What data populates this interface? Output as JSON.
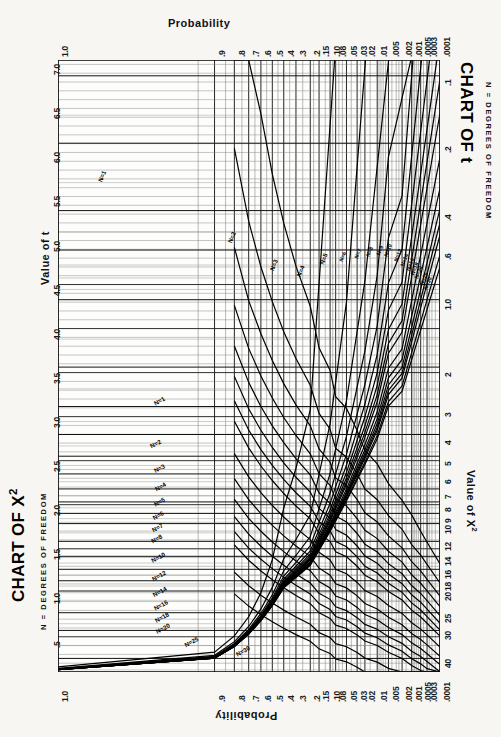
{
  "document": {
    "kind": "statistical-nomogram-sheet",
    "orientation": "rotated-90-degrees",
    "background_color": "#f7f6f3",
    "ink_color": "#111111"
  },
  "chart_t": {
    "title": "CHART OF t",
    "subtitle": "N = DEGREES OF FREEDOM",
    "value_axis_title": "Value of t",
    "probability_axis_title": "Probability",
    "value_ticks": [
      "7.0",
      "6.5",
      "6.0",
      "5.5",
      "5.0",
      "4.5",
      "4.0",
      "3.5",
      "3.0",
      "2.5",
      "2.0",
      "1.5",
      "1.0",
      ".5"
    ],
    "probability_ticks": [
      "1.0",
      ".9",
      ".8",
      ".7",
      ".6",
      ".5",
      ".4",
      ".3",
      ".2",
      ".15",
      ".10",
      ".08",
      ".05",
      ".03",
      ".02",
      ".01",
      ".005",
      ".002",
      ".001",
      ".0005",
      ".0003",
      ".0001"
    ],
    "curve_labels": [
      "N=1",
      "N=2",
      "N=3",
      "N=4",
      "N=5",
      "N=6",
      "N=7",
      "N=8",
      "N=9",
      "N=10",
      "N=12",
      "N=14",
      "N=16",
      "N=18",
      "N=20",
      "N=25",
      "N=30"
    ]
  },
  "chart_chisq": {
    "title": "CHART OF X2",
    "title_base": "CHART OF X",
    "title_exponent": "2",
    "subtitle": "N = DEGREES OF FREEDOM",
    "value_axis_title": "Value of X2",
    "value_axis_title_base": "Value of X",
    "value_axis_title_exponent": "2",
    "probability_axis_title": "Probability",
    "value_ticks": [
      ".1",
      ".2",
      ".4",
      ".6",
      "1.0",
      "2",
      "3",
      "4",
      "5",
      "6",
      "7",
      "8",
      "9",
      "10",
      "12",
      "14",
      "16",
      "18",
      "20",
      "25",
      "30",
      "40"
    ],
    "probability_ticks": [
      ".0001",
      ".0003",
      ".0005",
      ".001",
      ".002",
      ".005",
      ".01",
      ".02",
      ".03",
      ".05",
      ".08",
      ".10",
      ".15",
      ".2",
      ".3",
      ".4",
      ".5",
      ".6",
      ".7",
      ".8",
      ".9",
      "1.0"
    ],
    "curve_labels": [
      "N=1",
      "N=2",
      "N=3",
      "N=4",
      "N=5",
      "N=6",
      "N=7",
      "N=8",
      "N=10",
      "N=12",
      "N=14",
      "N=16",
      "N=18",
      "N=20",
      "N=25",
      "N=30"
    ]
  },
  "chart_data": {
    "type": "line",
    "subtitle": "N = DEGREES OF FREEDOM",
    "grid": true,
    "legend": "inline-curve-labels",
    "xlabel": "Probability",
    "ylabel_t": "Value of t",
    "ylabel_chisq": "Value of X2",
    "x": [
      0.0001,
      0.0003,
      0.0005,
      0.001,
      0.002,
      0.005,
      0.01,
      0.02,
      0.03,
      0.05,
      0.08,
      0.1,
      0.15,
      0.2,
      0.3,
      0.4,
      0.5,
      0.6,
      0.7,
      0.8,
      0.9,
      1.0
    ],
    "xlim_t": [
      1.0,
      0.0001
    ],
    "ylim_t": [
      7.0,
      0.0
    ],
    "xlim_chisq": [
      0.0001,
      1.0
    ],
    "ylim_chisq": [
      0.1,
      45
    ],
    "series_t": [
      {
        "name": "N=1",
        "values": [
          636.6,
          212.2,
          127.3,
          63.66,
          31.82,
          12.71,
          6.314,
          3.078,
          2.414,
          1.963,
          1.376,
          1.0,
          0.727,
          0.51,
          0.325,
          0.158,
          0.0
        ]
      },
      {
        "name": "N=2",
        "values": [
          31.6,
          17.28,
          14.09,
          9.925,
          6.965,
          4.303,
          2.92,
          1.886,
          1.604,
          1.386,
          1.061,
          0.816,
          0.617,
          0.445,
          0.289,
          0.142,
          0.0
        ]
      },
      {
        "name": "N=3",
        "values": [
          12.92,
          9.21,
          7.85,
          5.841,
          4.541,
          3.182,
          2.353,
          1.638,
          1.423,
          1.25,
          0.978,
          0.765,
          0.584,
          0.424,
          0.277,
          0.137,
          0.0
        ]
      },
      {
        "name": "N=4",
        "values": [
          8.61,
          6.62,
          5.95,
          4.604,
          3.747,
          2.776,
          2.132,
          1.533,
          1.344,
          1.19,
          0.941,
          0.741,
          0.569,
          0.414,
          0.271,
          0.134,
          0.0
        ]
      },
      {
        "name": "N=5",
        "values": [
          6.869,
          5.51,
          5.03,
          4.032,
          3.365,
          2.571,
          2.015,
          1.476,
          1.301,
          1.156,
          0.92,
          0.727,
          0.559,
          0.408,
          0.267,
          0.132,
          0.0
        ]
      },
      {
        "name": "N=6",
        "values": [
          5.959,
          4.9,
          4.52,
          3.707,
          3.143,
          2.447,
          1.943,
          1.44,
          1.273,
          1.134,
          0.906,
          0.718,
          0.553,
          0.404,
          0.265,
          0.131,
          0.0
        ]
      },
      {
        "name": "N=7",
        "values": [
          5.408,
          4.53,
          4.21,
          3.499,
          2.998,
          2.365,
          1.895,
          1.415,
          1.254,
          1.119,
          0.896,
          0.711,
          0.549,
          0.402,
          0.263,
          0.13,
          0.0
        ]
      },
      {
        "name": "N=8",
        "values": [
          5.041,
          4.28,
          3.99,
          3.355,
          2.896,
          2.306,
          1.86,
          1.397,
          1.24,
          1.108,
          0.889,
          0.706,
          0.546,
          0.399,
          0.262,
          0.13,
          0.0
        ]
      },
      {
        "name": "N=9",
        "values": [
          4.781,
          4.09,
          3.83,
          3.25,
          2.821,
          2.262,
          1.833,
          1.383,
          1.23,
          1.1,
          0.883,
          0.703,
          0.543,
          0.398,
          0.261,
          0.129,
          0.0
        ]
      },
      {
        "name": "N=10",
        "values": [
          4.587,
          3.96,
          3.72,
          3.169,
          2.764,
          2.228,
          1.812,
          1.372,
          1.221,
          1.093,
          0.879,
          0.7,
          0.542,
          0.397,
          0.26,
          0.129,
          0.0
        ]
      },
      {
        "name": "N=12",
        "values": [
          4.318,
          3.77,
          3.55,
          3.055,
          2.681,
          2.179,
          1.782,
          1.356,
          1.209,
          1.083,
          0.873,
          0.695,
          0.539,
          0.395,
          0.259,
          0.128,
          0.0
        ]
      },
      {
        "name": "N=14",
        "values": [
          4.14,
          3.65,
          3.44,
          2.977,
          2.624,
          2.145,
          1.761,
          1.345,
          1.2,
          1.076,
          0.868,
          0.692,
          0.537,
          0.393,
          0.258,
          0.128,
          0.0
        ]
      },
      {
        "name": "N=16",
        "values": [
          4.015,
          3.56,
          3.36,
          2.921,
          2.583,
          2.12,
          1.746,
          1.337,
          1.194,
          1.071,
          0.865,
          0.69,
          0.535,
          0.392,
          0.258,
          0.128,
          0.0
        ]
      },
      {
        "name": "N=18",
        "values": [
          3.922,
          3.49,
          3.3,
          2.878,
          2.552,
          2.101,
          1.734,
          1.33,
          1.189,
          1.067,
          0.862,
          0.688,
          0.534,
          0.392,
          0.257,
          0.127,
          0.0
        ]
      },
      {
        "name": "N=20",
        "values": [
          3.85,
          3.44,
          3.25,
          2.845,
          2.528,
          2.086,
          1.725,
          1.325,
          1.185,
          1.064,
          0.86,
          0.687,
          0.533,
          0.391,
          0.257,
          0.127,
          0.0
        ]
      },
      {
        "name": "N=25",
        "values": [
          3.725,
          3.35,
          3.17,
          2.787,
          2.485,
          2.06,
          1.708,
          1.316,
          1.178,
          1.058,
          0.856,
          0.684,
          0.531,
          0.39,
          0.256,
          0.127,
          0.0
        ]
      },
      {
        "name": "N=30",
        "values": [
          3.646,
          3.29,
          3.12,
          2.75,
          2.457,
          2.042,
          1.697,
          1.31,
          1.173,
          1.055,
          0.854,
          0.683,
          0.53,
          0.389,
          0.256,
          0.127,
          0.0
        ]
      }
    ],
    "series_chisq": [
      {
        "name": "N=1",
        "values": [
          15.14,
          12.12,
          10.83,
          9.14,
          7.88,
          6.63,
          5.41,
          4.71,
          3.84,
          3.06,
          2.71,
          2.07,
          1.64,
          1.07,
          0.708,
          0.455,
          0.275,
          0.148,
          0.0642,
          0.0158,
          0.0
        ]
      },
      {
        "name": "N=2",
        "values": [
          18.42,
          15.2,
          13.82,
          12.43,
          10.6,
          9.21,
          7.82,
          7.01,
          5.99,
          5.05,
          4.61,
          3.79,
          3.22,
          2.41,
          1.83,
          1.39,
          1.02,
          0.713,
          0.446,
          0.211,
          0.0
        ]
      },
      {
        "name": "N=3",
        "values": [
          21.11,
          17.73,
          16.27,
          14.8,
          12.84,
          11.34,
          9.84,
          8.95,
          7.81,
          6.75,
          6.25,
          5.32,
          4.64,
          3.66,
          2.95,
          2.37,
          1.87,
          1.42,
          1.01,
          0.584,
          0.0
        ]
      },
      {
        "name": "N=4",
        "values": [
          23.51,
          19.99,
          18.47,
          16.92,
          14.86,
          13.28,
          11.67,
          10.71,
          9.49,
          8.34,
          7.78,
          6.74,
          5.99,
          4.88,
          4.04,
          3.36,
          2.75,
          2.19,
          1.65,
          1.06,
          0.0
        ]
      },
      {
        "name": "N=5",
        "values": [
          25.74,
          22.1,
          20.51,
          18.91,
          16.75,
          15.09,
          13.39,
          12.37,
          11.07,
          9.83,
          9.24,
          8.12,
          7.29,
          6.06,
          5.13,
          4.35,
          3.66,
          3.0,
          2.34,
          1.61,
          0.0
        ]
      },
      {
        "name": "N=6",
        "values": [
          27.86,
          24.1,
          22.46,
          20.79,
          18.55,
          16.81,
          15.03,
          13.97,
          12.59,
          11.28,
          10.64,
          9.45,
          8.56,
          7.23,
          6.21,
          5.35,
          4.57,
          3.83,
          3.07,
          2.2,
          0.0
        ]
      },
      {
        "name": "N=7",
        "values": [
          29.88,
          26.02,
          24.32,
          22.6,
          20.28,
          18.48,
          16.62,
          15.51,
          14.07,
          12.69,
          12.02,
          10.75,
          9.8,
          8.38,
          7.28,
          6.35,
          5.49,
          4.67,
          3.82,
          2.83,
          0.0
        ]
      },
      {
        "name": "N=8",
        "values": [
          31.83,
          27.87,
          26.12,
          24.35,
          21.95,
          20.09,
          18.17,
          17.01,
          15.51,
          14.07,
          13.36,
          12.03,
          11.03,
          9.52,
          8.35,
          7.34,
          6.42,
          5.53,
          4.59,
          3.49,
          0.0
        ]
      },
      {
        "name": "N=10",
        "values": [
          35.56,
          31.42,
          29.59,
          27.72,
          25.19,
          23.21,
          21.16,
          19.92,
          18.31,
          16.75,
          15.99,
          14.53,
          13.44,
          11.78,
          10.47,
          9.34,
          8.3,
          7.27,
          6.18,
          4.87,
          0.0
        ]
      },
      {
        "name": "N=12",
        "values": [
          39.13,
          34.82,
          32.91,
          30.96,
          28.3,
          26.22,
          24.05,
          22.74,
          21.03,
          19.37,
          18.55,
          16.99,
          15.81,
          14.01,
          12.58,
          11.34,
          10.18,
          9.03,
          7.81,
          6.3,
          0.0
        ]
      },
      {
        "name": "N=14",
        "values": [
          42.58,
          38.11,
          36.12,
          34.09,
          31.32,
          29.14,
          26.87,
          25.49,
          23.68,
          21.93,
          21.06,
          19.4,
          18.15,
          16.22,
          14.68,
          13.34,
          12.08,
          10.82,
          9.47,
          7.79,
          0.0
        ]
      },
      {
        "name": "N=16",
        "values": [
          45.94,
          41.31,
          39.25,
          37.15,
          34.27,
          32.0,
          29.63,
          28.19,
          26.3,
          24.46,
          23.54,
          21.79,
          20.47,
          18.42,
          16.78,
          15.34,
          13.98,
          12.62,
          11.15,
          9.31,
          0.0
        ]
      },
      {
        "name": "N=18",
        "values": [
          49.22,
          44.43,
          42.31,
          40.14,
          37.16,
          34.81,
          32.35,
          30.84,
          28.87,
          26.95,
          25.99,
          24.16,
          22.76,
          20.6,
          18.87,
          17.34,
          15.89,
          14.44,
          12.86,
          10.86,
          0.0
        ]
      },
      {
        "name": "N=20",
        "values": [
          52.44,
          47.5,
          45.31,
          43.07,
          40.0,
          37.57,
          35.02,
          33.45,
          31.41,
          29.41,
          28.41,
          26.5,
          25.04,
          22.77,
          20.95,
          19.34,
          17.81,
          16.27,
          14.58,
          12.44,
          0.0
        ]
      },
      {
        "name": "N=25",
        "values": [
          60.27,
          55.0,
          52.65,
          50.25,
          46.93,
          44.31,
          41.57,
          39.87,
          37.65,
          35.47,
          34.38,
          32.28,
          30.68,
          28.17,
          26.14,
          24.34,
          22.62,
          20.87,
          18.94,
          16.47,
          0.0
        ]
      },
      {
        "name": "N=30",
        "values": [
          67.8,
          62.24,
          59.7,
          57.17,
          53.67,
          50.89,
          47.96,
          46.16,
          43.77,
          41.42,
          40.26,
          37.99,
          36.25,
          33.53,
          31.32,
          29.34,
          27.44,
          25.51,
          23.36,
          20.6,
          0.0
        ]
      }
    ]
  }
}
